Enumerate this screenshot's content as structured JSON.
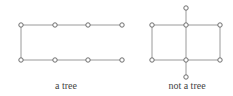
{
  "figures": [
    {
      "caption": "a tree",
      "caption_x": 66,
      "nodes": [
        [
          21,
          25
        ],
        [
          55,
          25
        ],
        [
          88,
          25
        ],
        [
          122,
          25
        ],
        [
          21,
          60
        ],
        [
          55,
          60
        ],
        [
          88,
          60
        ],
        [
          122,
          60
        ]
      ],
      "edges": [
        [
          0,
          1
        ],
        [
          1,
          2
        ],
        [
          2,
          3
        ],
        [
          0,
          4
        ],
        [
          4,
          5
        ],
        [
          5,
          6
        ],
        [
          6,
          7
        ]
      ]
    },
    {
      "caption": "not a tree",
      "caption_x": 187,
      "nodes": [
        [
          186,
          8
        ],
        [
          152,
          25
        ],
        [
          186,
          25
        ],
        [
          220,
          25
        ],
        [
          152,
          60
        ],
        [
          186,
          60
        ],
        [
          220,
          60
        ],
        [
          186,
          77
        ]
      ],
      "edges": [
        [
          0,
          2
        ],
        [
          1,
          2
        ],
        [
          2,
          3
        ],
        [
          1,
          4
        ],
        [
          2,
          5
        ],
        [
          3,
          6
        ],
        [
          4,
          5
        ],
        [
          5,
          6
        ],
        [
          5,
          7
        ]
      ]
    }
  ]
}
